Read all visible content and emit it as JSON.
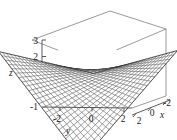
{
  "figure": {
    "kind": "3d-surface-plot",
    "background_color": "#ffffff",
    "mesh_color": "#2b2b2b",
    "box_color": "#6e6e6e",
    "axis_color": "#4a4a4a"
  },
  "chart_data": {
    "type": "surface",
    "title": "",
    "subtitle": "",
    "xlabel": "x",
    "ylabel": "y",
    "zlabel": "z",
    "xlim": [
      -2.5,
      2.5
    ],
    "ylim": [
      -3,
      3
    ],
    "zlim": [
      -1,
      3
    ],
    "xticks": [
      2,
      0,
      -2
    ],
    "xtick_labels": [
      "2",
      "0",
      "-2"
    ],
    "yticks": [
      -2,
      0,
      2
    ],
    "ytick_labels": [
      "-2",
      "0",
      "2"
    ],
    "zticks": [
      -1,
      0,
      1,
      2,
      3
    ],
    "ztick_labels": [
      "-1",
      "0",
      "1",
      "2",
      "3"
    ],
    "grid": false,
    "legend": null,
    "annotations": [],
    "surface_shape": "saddle",
    "surface_description": "hyperbolic paraboloid style saddle surface rendered as a fine wireframe mesh, rising at the far-left and near-right corners and dipping at the near-left and far-right corners",
    "mesh_rows": 26,
    "mesh_cols": 26,
    "view": {
      "azimuth": -60,
      "elevation": 25
    },
    "z_surface_corners": {
      "x_neg_y_neg": 3.0,
      "x_neg_y_pos": -1.0,
      "x_pos_y_neg": -1.0,
      "x_pos_y_pos": 3.0,
      "center": 1.0
    }
  },
  "axes": {
    "z": {
      "label": "z",
      "ticks": [
        {
          "value": "3",
          "x": 33,
          "y": 42
        },
        {
          "value": "2",
          "x": 33,
          "y": 58
        },
        {
          "value": "1",
          "x": 33,
          "y": 74
        },
        {
          "value": "0",
          "x": 33,
          "y": 90
        },
        {
          "value": "-1",
          "x": 31,
          "y": 106
        }
      ]
    },
    "y": {
      "label": "y",
      "ticks": [
        {
          "value": "-2",
          "x": 56,
          "y": 118
        },
        {
          "value": "0",
          "x": 90,
          "y": 118
        },
        {
          "value": "2",
          "x": 122,
          "y": 118
        }
      ]
    },
    "x": {
      "label": "x",
      "ticks": [
        {
          "value": "2",
          "x": 137,
          "y": 123
        },
        {
          "value": "0",
          "x": 150,
          "y": 114
        },
        {
          "value": "-2",
          "x": 164,
          "y": 104
        }
      ]
    }
  }
}
